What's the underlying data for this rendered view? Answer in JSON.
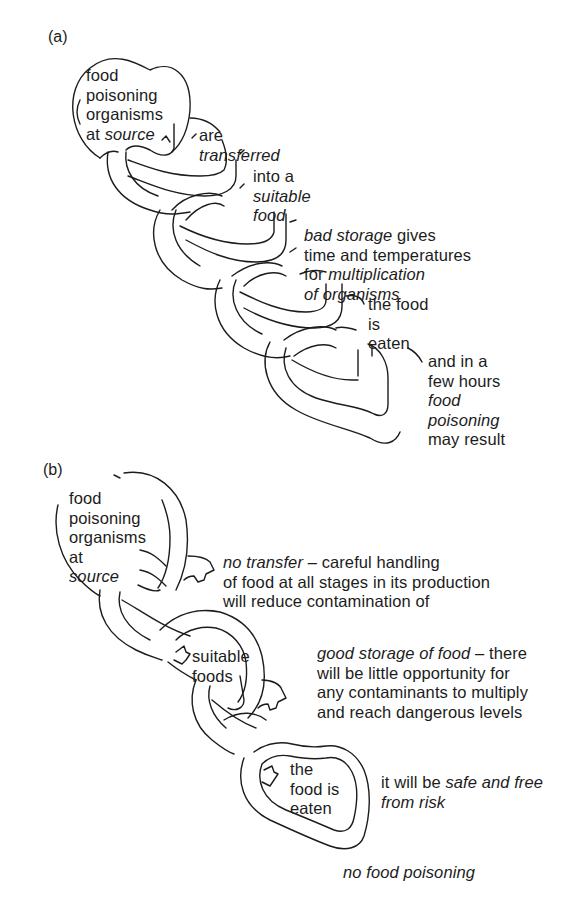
{
  "panels": [
    {
      "id": "a",
      "label": "(a)",
      "steps": [
        {
          "text_lines": [
            "food",
            "poisoning",
            "organisms"
          ],
          "line4_plain": "at ",
          "line4_italic": "source"
        },
        {
          "line1": "are",
          "line2_italic": "transferred"
        },
        {
          "line1": "into a",
          "line2_italic": "suitable",
          "line3_italic": "food"
        },
        {
          "line1_italic": "bad storage",
          "line1_plain": " gives",
          "line2": "time and temperatures",
          "line3_plain": "for ",
          "line3_italic": "multiplication",
          "line4_italic": "of organisms"
        },
        {
          "line1": "the food",
          "line2": "is",
          "line3": "eaten"
        },
        {
          "line1": "and in a",
          "line2": "few hours",
          "line3_italic": "food",
          "line4_italic": "poisoning",
          "line5": "may result"
        }
      ]
    },
    {
      "id": "b",
      "label": "(b)",
      "source": {
        "lines": [
          "food",
          "poisoning",
          "organisms",
          "at"
        ],
        "italic_line": "source"
      },
      "no_transfer": {
        "italic": "no transfer",
        "rest": " – careful handling",
        "line2": "of food at all stages in its production",
        "line3": "will reduce contamination of"
      },
      "suitable_foods": {
        "lines": [
          "suitable",
          "foods"
        ]
      },
      "good_storage": {
        "italic": "good storage of food",
        "rest": " – there",
        "line2": "will be little opportunity for",
        "line3": "any contaminants to multiply",
        "line4": "and reach dangerous levels"
      },
      "food_eaten": {
        "lines": [
          "the",
          "food is",
          "eaten"
        ]
      },
      "safe": {
        "plain": "it will be ",
        "italic": "safe and free",
        "line2_italic": "from risk"
      },
      "conclusion": "no food poisoning"
    }
  ],
  "colors": {
    "ink": "#1c1c1c",
    "background": "#ffffff"
  }
}
